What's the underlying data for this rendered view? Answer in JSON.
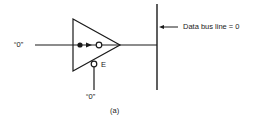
{
  "diagram": {
    "type": "tri-state buffer driving data bus",
    "input_label": "“0”",
    "enable_label": "E",
    "enable_input_label": "“0”",
    "bus_label": "Data bus line = 0",
    "caption": "(a)",
    "colors": {
      "stroke": "#1a1a1a",
      "background": "#ffffff"
    }
  }
}
